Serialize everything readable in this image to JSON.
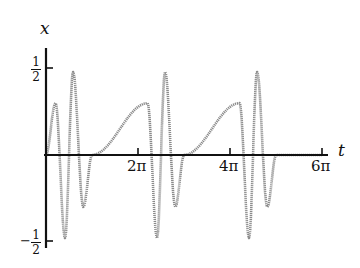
{
  "chart_data": {
    "type": "line",
    "title": "",
    "xlabel": "t",
    "ylabel": "x",
    "xlim": [
      0,
      18.85
    ],
    "ylim": [
      -0.5,
      0.5
    ],
    "grid": false,
    "legend": null,
    "x_ticks": [
      {
        "value": 6.2832,
        "label": "2π"
      },
      {
        "value": 12.5664,
        "label": "4π"
      },
      {
        "value": 18.8496,
        "label": "6π"
      }
    ],
    "y_ticks": [
      {
        "value": 0.5,
        "label": "1/2",
        "numerator": "1",
        "denominator": "2",
        "sign": ""
      },
      {
        "value": -0.5,
        "label": "-1/2",
        "numerator": "1",
        "denominator": "2",
        "sign": "−"
      }
    ],
    "series": [
      {
        "name": "x(t)",
        "color": "#8a8a8a",
        "period": 6.2832,
        "extrema_per_period": [
          {
            "t": 0.65,
            "x": 0.3
          },
          {
            "t": 1.3,
            "x": -0.48
          },
          {
            "t": 1.85,
            "x": 0.48
          },
          {
            "t": 2.55,
            "x": -0.3
          },
          {
            "t": 3.15,
            "x": 0.0
          }
        ],
        "x": [
          0.0,
          0.3,
          0.65,
          1.0,
          1.3,
          1.6,
          1.85,
          2.2,
          2.55,
          2.9,
          3.14,
          3.5,
          3.8,
          4.1,
          4.4,
          4.7,
          5.0,
          5.3,
          5.6,
          6.0,
          6.28
        ],
        "values": [
          0.0,
          0.16,
          0.3,
          -0.05,
          -0.48,
          -0.05,
          0.48,
          0.08,
          -0.3,
          -0.12,
          0.0,
          0.16,
          0.3,
          -0.05,
          -0.48,
          -0.05,
          0.48,
          0.08,
          -0.3,
          -0.12,
          0.0
        ]
      }
    ]
  },
  "axes": {
    "x_label": "t",
    "y_label": "x",
    "x_tick_labels": [
      "2π",
      "4π",
      "6π"
    ],
    "y_tick_top": {
      "num": "1",
      "den": "2",
      "sign": ""
    },
    "y_tick_bottom": {
      "num": "1",
      "den": "2",
      "sign": "−"
    }
  }
}
